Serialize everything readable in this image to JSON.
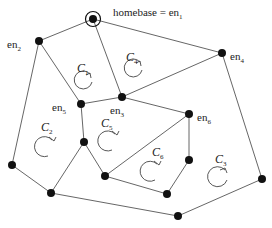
{
  "homebase_label": "homebase = en",
  "homebase_sub": "1",
  "nodes": [
    {
      "id": "en1",
      "x": 93,
      "y": 19,
      "homebase": true
    },
    {
      "id": "en2",
      "x": 39,
      "y": 41
    },
    {
      "id": "en4",
      "x": 222,
      "y": 53
    },
    {
      "id": "en3",
      "x": 122,
      "y": 97
    },
    {
      "id": "en5",
      "x": 81,
      "y": 104
    },
    {
      "id": "n_c2c5",
      "x": 84,
      "y": 142
    },
    {
      "id": "en6",
      "x": 189,
      "y": 114
    },
    {
      "id": "n_e6b",
      "x": 189,
      "y": 160
    },
    {
      "id": "n_left",
      "x": 12,
      "y": 165
    },
    {
      "id": "n_bl",
      "x": 51,
      "y": 193
    },
    {
      "id": "n_mid",
      "x": 105,
      "y": 176
    },
    {
      "id": "n_c6b",
      "x": 167,
      "y": 194
    },
    {
      "id": "n_bot",
      "x": 178,
      "y": 216
    },
    {
      "id": "n_right",
      "x": 262,
      "y": 179
    }
  ],
  "node_labels": [
    {
      "text": "en",
      "sub": "2",
      "x": 7,
      "y": 48
    },
    {
      "text": "en",
      "sub": "4",
      "x": 230,
      "y": 60
    },
    {
      "text": "en",
      "sub": "3",
      "x": 110,
      "y": 114
    },
    {
      "text": "en",
      "sub": "5",
      "x": 52,
      "y": 111
    },
    {
      "text": "en",
      "sub": "6",
      "x": 197,
      "y": 121
    }
  ],
  "cycles": [
    {
      "label": "C",
      "sub": "1",
      "lx": 77,
      "ly": 72,
      "cx": 83,
      "cy": 81,
      "dir": "ccw"
    },
    {
      "label": "C",
      "sub": "4",
      "lx": 126,
      "ly": 61,
      "cx": 133,
      "cy": 69,
      "dir": "ccw"
    },
    {
      "label": "C",
      "sub": "2",
      "lx": 41,
      "ly": 131,
      "cx": 44,
      "cy": 147,
      "dir": "cw"
    },
    {
      "label": "C",
      "sub": "5",
      "lx": 101,
      "ly": 127,
      "cx": 107,
      "cy": 141,
      "dir": "cw"
    },
    {
      "label": "C",
      "sub": "6",
      "lx": 152,
      "ly": 156,
      "cx": 150,
      "cy": 171,
      "dir": "cw"
    },
    {
      "label": "C",
      "sub": "3",
      "lx": 215,
      "ly": 163,
      "cx": 217,
      "cy": 178,
      "dir": "ccw"
    }
  ]
}
